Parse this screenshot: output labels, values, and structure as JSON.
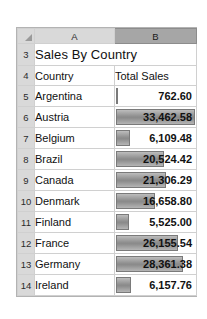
{
  "app": {
    "type": "spreadsheet",
    "corner_icon": "select-all-triangle-icon"
  },
  "columns": {
    "headers": [
      {
        "label": "A",
        "selected": false
      },
      {
        "label": "B",
        "selected": true
      }
    ]
  },
  "title_row": {
    "row_number": "3",
    "title": "Sales By Country"
  },
  "header_row": {
    "row_number": "4",
    "col_a": "Country",
    "col_b": "Total Sales"
  },
  "rows": [
    {
      "row_number": "5",
      "country": "Argentina",
      "sales": "762.60",
      "value": 762.6,
      "bar_pct": 2.3
    },
    {
      "row_number": "6",
      "country": "Austria",
      "sales": "33,462.58",
      "value": 33462.58,
      "bar_pct": 100.0
    },
    {
      "row_number": "7",
      "country": "Belgium",
      "sales": "6,109.48",
      "value": 6109.48,
      "bar_pct": 18.3
    },
    {
      "row_number": "8",
      "country": "Brazil",
      "sales": "20,524.42",
      "value": 20524.42,
      "bar_pct": 61.3
    },
    {
      "row_number": "9",
      "country": "Canada",
      "sales": "21,306.29",
      "value": 21306.29,
      "bar_pct": 63.7
    },
    {
      "row_number": "10",
      "country": "Denmark",
      "sales": "16,658.80",
      "value": 16658.8,
      "bar_pct": 49.8
    },
    {
      "row_number": "11",
      "country": "Finland",
      "sales": "5,525.00",
      "value": 5525.0,
      "bar_pct": 16.5
    },
    {
      "row_number": "12",
      "country": "France",
      "sales": "26,155.54",
      "value": 26155.54,
      "bar_pct": 78.2
    },
    {
      "row_number": "13",
      "country": "Germany",
      "sales": "28,361.38",
      "value": 28361.38,
      "bar_pct": 84.8
    },
    {
      "row_number": "14",
      "country": "Ireland",
      "sales": "6,157.76",
      "value": 6157.76,
      "bar_pct": 18.4
    }
  ],
  "chart_data": {
    "type": "bar",
    "title": "Sales By Country",
    "xlabel": "Country",
    "ylabel": "Total Sales",
    "categories": [
      "Argentina",
      "Austria",
      "Belgium",
      "Brazil",
      "Canada",
      "Denmark",
      "Finland",
      "France",
      "Germany",
      "Ireland"
    ],
    "values": [
      762.6,
      33462.58,
      6109.48,
      20524.42,
      21306.29,
      16658.8,
      5525.0,
      26155.54,
      28361.38,
      6157.76
    ],
    "xlim": [
      0,
      33462.58
    ],
    "grid": false,
    "legend": "none",
    "note": "in-cell data bars, conditional formatting"
  },
  "colors": {
    "bar_fill": "#8f8f8f",
    "bar_border": "#7a7a7a",
    "header_bg": "#d9d9d9",
    "header_selected_bg": "#a6a6a6",
    "gridline": "#d0d0d0"
  }
}
